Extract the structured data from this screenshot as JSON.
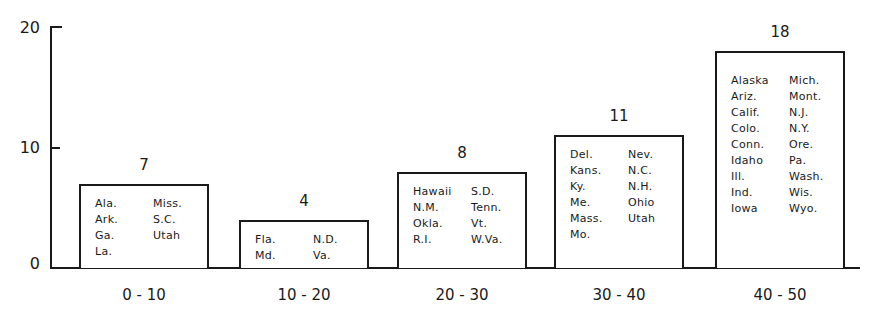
{
  "chart_data": {
    "type": "bar",
    "title": "",
    "xlabel": "",
    "ylabel": "",
    "ylim": [
      0,
      20
    ],
    "yticks": [
      "0",
      "10",
      "20"
    ],
    "categories": [
      "0 - 10",
      "10 - 20",
      "20 - 30",
      "30 - 40",
      "40 - 50"
    ],
    "values": [
      7,
      4,
      8,
      11,
      18
    ],
    "value_labels": [
      "7",
      "4",
      "8",
      "11",
      "18"
    ],
    "grid": false,
    "annotations": [
      {
        "category": "0 - 10",
        "col1": [
          "Ala.",
          "Ark.",
          "Ga.",
          "La."
        ],
        "col2": [
          "Miss.",
          "S.C.",
          "Utah"
        ]
      },
      {
        "category": "10 - 20",
        "col1": [
          "Fla.",
          "Md."
        ],
        "col2": [
          "N.D.",
          "Va."
        ]
      },
      {
        "category": "20 - 30",
        "col1": [
          "Hawaii",
          "N.M.",
          "Okla.",
          "R.I."
        ],
        "col2": [
          "S.D.",
          "Tenn.",
          "Vt.",
          "W.Va."
        ]
      },
      {
        "category": "30 - 40",
        "col1": [
          "Del.",
          "Kans.",
          "Ky.",
          "Me.",
          "Mass.",
          "Mo."
        ],
        "col2": [
          "Nev.",
          "N.C.",
          "N.H.",
          "Ohio",
          "Utah"
        ]
      },
      {
        "category": "40 - 50",
        "col1": [
          "Alaska",
          "Ariz.",
          "Calif.",
          "Colo.",
          "Conn.",
          "Idaho",
          "Ill.",
          "Ind.",
          "Iowa"
        ],
        "col2": [
          "Mich.",
          "Mont.",
          "N.J.",
          "N.Y.",
          "Ore.",
          "Pa.",
          "Wash.",
          "Wis.",
          "Wyo."
        ]
      }
    ]
  },
  "axis": {
    "y0": "0",
    "y10": "10",
    "y20": "20"
  }
}
